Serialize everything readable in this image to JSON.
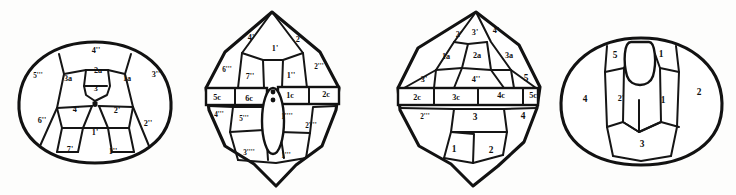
{
  "figure": {
    "panel_count": 4,
    "ink_color": "#121212",
    "paper_color": "#fdfdfc"
  },
  "panels": [
    {
      "id": "panel-1",
      "name": "apical-view",
      "caption": "",
      "labels": [
        {
          "text": "4''",
          "x": 96,
          "y": 51
        },
        {
          "text": "5'''",
          "x": 38,
          "y": 76
        },
        {
          "text": "3a",
          "x": 68,
          "y": 79
        },
        {
          "text": "2a",
          "x": 98,
          "y": 71
        },
        {
          "text": "3'",
          "x": 97,
          "y": 89
        },
        {
          "text": "1a",
          "x": 127,
          "y": 79
        },
        {
          "text": "3''",
          "x": 156,
          "y": 75
        },
        {
          "text": "4'",
          "x": 76,
          "y": 110
        },
        {
          "text": "2'",
          "x": 117,
          "y": 111
        },
        {
          "text": "6''",
          "x": 42,
          "y": 121
        },
        {
          "text": "2''",
          "x": 148,
          "y": 124
        },
        {
          "text": "1'",
          "x": 95,
          "y": 133
        },
        {
          "text": "7'",
          "x": 70,
          "y": 150
        },
        {
          "text": "1''",
          "x": 113,
          "y": 152
        }
      ]
    },
    {
      "id": "panel-2",
      "name": "dorsal-view",
      "caption": "",
      "labels": [
        {
          "text": "4'",
          "x": 71,
          "y": 38
        },
        {
          "text": "1'",
          "x": 95,
          "y": 49
        },
        {
          "text": "2'",
          "x": 119,
          "y": 40
        },
        {
          "text": "6'''",
          "x": 47,
          "y": 70
        },
        {
          "text": "7''",
          "x": 70,
          "y": 77
        },
        {
          "text": "1''",
          "x": 111,
          "y": 76
        },
        {
          "text": "2'''",
          "x": 139,
          "y": 67
        },
        {
          "text": "5c",
          "x": 37,
          "y": 98
        },
        {
          "text": "6c",
          "x": 69,
          "y": 99
        },
        {
          "text": "1c",
          "x": 110,
          "y": 96
        },
        {
          "text": "2c",
          "x": 146,
          "y": 95
        },
        {
          "text": "4'''",
          "x": 39,
          "y": 115
        },
        {
          "text": "5'''",
          "x": 64,
          "y": 119
        },
        {
          "text": "1''''",
          "x": 107,
          "y": 117
        },
        {
          "text": "2''''",
          "x": 131,
          "y": 126
        },
        {
          "text": "3''''",
          "x": 69,
          "y": 153
        },
        {
          "text": "1'''",
          "x": 106,
          "y": 156
        }
      ]
    },
    {
      "id": "panel-3",
      "name": "ventral-view",
      "caption": "",
      "labels": [
        {
          "text": "2'",
          "x": 103,
          "y": 35
        },
        {
          "text": "3'",
          "x": 119,
          "y": 33
        },
        {
          "text": "4'",
          "x": 140,
          "y": 31
        },
        {
          "text": "1a",
          "x": 90,
          "y": 57
        },
        {
          "text": "2a",
          "x": 121,
          "y": 56
        },
        {
          "text": "3a",
          "x": 153,
          "y": 56
        },
        {
          "text": "3'",
          "x": 68,
          "y": 80
        },
        {
          "text": "4''",
          "x": 120,
          "y": 80
        },
        {
          "text": "5",
          "x": 170,
          "y": 79
        },
        {
          "text": "2c",
          "x": 61,
          "y": 98
        },
        {
          "text": "3c",
          "x": 100,
          "y": 98
        },
        {
          "text": "4c",
          "x": 145,
          "y": 96
        },
        {
          "text": "5c",
          "x": 177,
          "y": 96
        },
        {
          "text": "2'''",
          "x": 69,
          "y": 117
        },
        {
          "text": "3",
          "x": 119,
          "y": 118
        },
        {
          "text": "4",
          "x": 167,
          "y": 117
        },
        {
          "text": "1",
          "x": 98,
          "y": 150
        },
        {
          "text": "2",
          "x": 135,
          "y": 151
        }
      ]
    },
    {
      "id": "panel-4",
      "name": "antapical-view",
      "caption": "",
      "labels": [
        {
          "text": "5",
          "x": 70,
          "y": 56
        },
        {
          "text": "1",
          "x": 116,
          "y": 55
        },
        {
          "text": "4",
          "x": 40,
          "y": 100
        },
        {
          "text": "2'",
          "x": 76,
          "y": 99
        },
        {
          "text": "1",
          "x": 118,
          "y": 101
        },
        {
          "text": "2",
          "x": 154,
          "y": 93
        },
        {
          "text": "3",
          "x": 97,
          "y": 145
        }
      ]
    }
  ]
}
